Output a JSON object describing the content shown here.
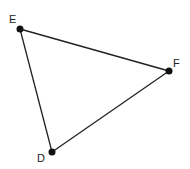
{
  "diagram": {
    "type": "triangle",
    "vertices": [
      {
        "name": "E",
        "x": 20,
        "y": 29,
        "label_x": 9,
        "label_y": 23
      },
      {
        "name": "F",
        "x": 169,
        "y": 71,
        "label_x": 173,
        "label_y": 67
      },
      {
        "name": "D",
        "x": 52,
        "y": 152,
        "label_x": 37,
        "label_y": 162
      }
    ],
    "edges": [
      [
        "E",
        "F"
      ],
      [
        "F",
        "D"
      ],
      [
        "D",
        "E"
      ]
    ],
    "colors": {
      "line": "#222222",
      "point": "#111111",
      "background": "#ffffff"
    }
  }
}
